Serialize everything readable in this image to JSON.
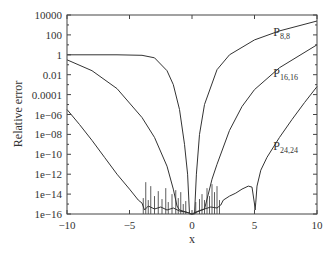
{
  "chart_data": {
    "type": "line",
    "title": "",
    "xlabel": "x",
    "ylabel": "Relative error",
    "xlim": [
      -10,
      10
    ],
    "ylim": [
      1e-16,
      10000
    ],
    "yscale": "log",
    "grid": false,
    "legend": "inline labels",
    "x_ticks": [
      "-10",
      "-5",
      "0",
      "5",
      "10"
    ],
    "y_ticks": [
      "10000",
      "100",
      "1",
      "0.01",
      "0.0001",
      "1e-06",
      "1e-08",
      "1e-10",
      "1e-12",
      "1e-14",
      "1e-16"
    ],
    "series": [
      {
        "name": "P8,8",
        "label_main": "P",
        "label_sub": "8,8",
        "x": [
          -10,
          -6,
          -4,
          -3,
          -2,
          -1.5,
          -1,
          -0.6,
          -0.35,
          -0.2,
          0,
          0.2,
          0.35,
          0.6,
          1,
          2,
          3,
          5,
          7,
          10
        ],
        "log10y": [
          0,
          0,
          -0.05,
          -0.3,
          -1.6,
          -3,
          -5.5,
          -9,
          -12,
          -16,
          -16,
          -16,
          -12,
          -8,
          -5,
          -1.5,
          0,
          1.5,
          2.4,
          3.4
        ]
      },
      {
        "name": "P16,16",
        "label_main": "P",
        "label_sub": "16,16",
        "x": [
          -10,
          -8,
          -6,
          -4,
          -3,
          -2,
          -1.5,
          -1.2,
          -1,
          0,
          1,
          1.3,
          1.6,
          2,
          3,
          4,
          5,
          7,
          10
        ],
        "log10y": [
          -0.5,
          -1.6,
          -3.4,
          -6.3,
          -8.3,
          -11.2,
          -13.5,
          -15.2,
          -15.6,
          -16,
          -15.5,
          -14,
          -12.5,
          -11,
          -7.6,
          -5.2,
          -3.5,
          -1.3,
          1
        ]
      },
      {
        "name": "P24,24",
        "label_main": "P",
        "label_sub": "24,24",
        "x": [
          -10,
          -9,
          -8,
          -7,
          -6,
          -5,
          -4.3,
          -4,
          -3.8,
          -3.5,
          -3,
          -2.5,
          -2,
          -1.5,
          -1,
          -0.5,
          0,
          0.5,
          1,
          1.5,
          2,
          2.3,
          2.5,
          3,
          3.5,
          4,
          4.5,
          4.8,
          5,
          5.05,
          5.1,
          5.2,
          5.5,
          6,
          7,
          8,
          9,
          10
        ],
        "log10y": [
          -5.5,
          -7.0,
          -8.6,
          -10.3,
          -12.0,
          -13.5,
          -14.6,
          -14.9,
          -15.6,
          -15.2,
          -15.5,
          -15.3,
          -15.6,
          -15.4,
          -15.7,
          -15.8,
          -16,
          -15.7,
          -15.5,
          -15.3,
          -15.4,
          -15.1,
          -14.6,
          -14.2,
          -13.9,
          -13.5,
          -13.2,
          -13.3,
          -15.0,
          -15.6,
          -14.8,
          -13.2,
          -11.6,
          -10.3,
          -8.3,
          -6.5,
          -4.8,
          -3.2
        ]
      }
    ],
    "annotations": [
      {
        "text": "P8,8",
        "x": 6.5,
        "log10y": 1.9
      },
      {
        "text": "P16,16",
        "x": 6.5,
        "log10y": -2.2
      },
      {
        "text": "P24,24",
        "x": 6.5,
        "log10y": -9.6
      }
    ]
  },
  "axes": {
    "x_label": "x",
    "y_label": "Relative error"
  }
}
